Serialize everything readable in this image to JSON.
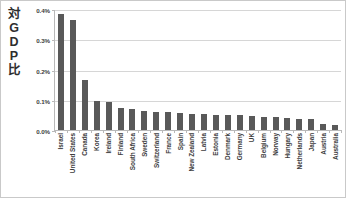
{
  "chart_data": {
    "type": "bar",
    "title": "",
    "subtitle": "",
    "xlabel": "",
    "ylabel": "対GDP比",
    "ylabel_chars": [
      "対",
      "G",
      "D",
      "P",
      "比"
    ],
    "ylim": [
      0,
      0.4
    ],
    "ytick_labels": [
      "0.0%",
      "0.1%",
      "0.2%",
      "0.3%",
      "0.4%"
    ],
    "ytick_values": [
      0.0,
      0.1,
      0.2,
      0.3,
      0.4
    ],
    "grid": true,
    "grid_axis": "y",
    "legend": false,
    "legend_position": "none",
    "bar_color": "#595959",
    "gridline_color": "#d6d6d6",
    "axis_color": "#b9b9b9",
    "categories": [
      "Israel",
      "United States",
      "Canada",
      "Korea",
      "Ireland",
      "Finland",
      "South Africa",
      "Sweden",
      "Switzerland",
      "France",
      "Spain",
      "New Zealand",
      "Latvia",
      "Estonia",
      "Denmark",
      "Germany",
      "UK",
      "Belgium",
      "Norway",
      "Hungary",
      "Netherlands",
      "Japan",
      "Austria",
      "Australia"
    ],
    "values": [
      0.385,
      0.365,
      0.165,
      0.096,
      0.094,
      0.074,
      0.07,
      0.062,
      0.06,
      0.058,
      0.056,
      0.054,
      0.052,
      0.05,
      0.05,
      0.048,
      0.046,
      0.044,
      0.042,
      0.04,
      0.038,
      0.036,
      0.02,
      0.018
    ]
  }
}
